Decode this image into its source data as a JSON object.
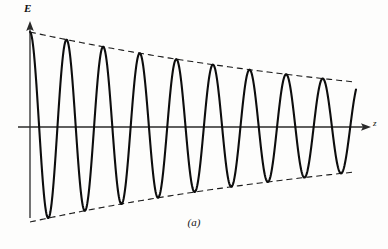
{
  "figure": {
    "caption": "(a)",
    "background_color": "#fdfdfc",
    "curve_color": "#0d0d0d",
    "axis_color": "#2a2a2a",
    "envelope_color": "#1a1a1a"
  },
  "axes": {
    "vertical": {
      "label": "E",
      "x": 30,
      "y_top": 22,
      "y_bottom": 218,
      "arrow": "up-arrow-icon"
    },
    "horizontal": {
      "label": "z",
      "y": 127,
      "x_left": 18,
      "x_right": 370,
      "arrow": "right-arrow-icon"
    }
  },
  "chart_data": {
    "type": "line",
    "title": "",
    "subtitle": "",
    "xlabel": "z",
    "ylabel": "E",
    "grid": false,
    "legend": null,
    "annotations": [
      "(a)"
    ],
    "xlim": [
      0,
      326
    ],
    "ylim": [
      -100,
      100
    ],
    "waveform": {
      "name": "damped-sine",
      "form": "E(z) = A0 * exp(-k*z) * cos(2*pi*z/period)",
      "amplitude_initial": 95,
      "amplitude_final": 45,
      "decay_constant": 0.0023,
      "period_px": 36.6,
      "cycles": 10,
      "phase": "cosine starts at positive peak near origin"
    },
    "envelope_upper": {
      "name": "upper-envelope",
      "style": "dashed",
      "x": [
        0,
        40,
        80,
        120,
        160,
        200,
        240,
        280,
        326
      ],
      "y": [
        95,
        87,
        80,
        73,
        67,
        61,
        55,
        50,
        45
      ]
    },
    "envelope_lower": {
      "name": "lower-envelope",
      "style": "dashed",
      "x": [
        0,
        40,
        80,
        120,
        160,
        200,
        240,
        280,
        326
      ],
      "y": [
        -95,
        -87,
        -80,
        -73,
        -67,
        -61,
        -55,
        -50,
        -45
      ]
    },
    "peaks_x_px": [
      37,
      74,
      111,
      147,
      184,
      221,
      257,
      294,
      331,
      355
    ],
    "series": [
      {
        "name": "E(z)",
        "x": [
          0,
          326
        ],
        "values": [
          95,
          -45
        ]
      }
    ]
  }
}
